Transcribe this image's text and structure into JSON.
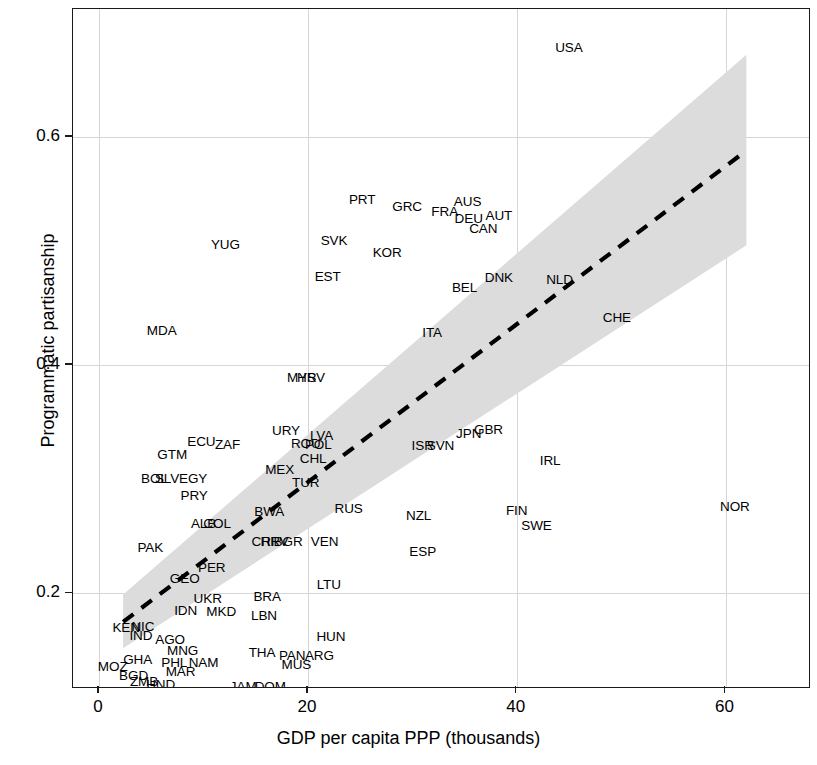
{
  "chart_data": {
    "type": "scatter",
    "title": "",
    "xlabel": "GDP per capita PPP (thousands)",
    "ylabel": "Programmatic partisanship",
    "xlim": [
      -2.5,
      68.0
    ],
    "ylim": [
      0.118,
      0.712
    ],
    "xticks": [
      0,
      20,
      40,
      60
    ],
    "xticklabels": [
      "0",
      "20",
      "40",
      "60"
    ],
    "yticks": [
      0.2,
      0.4,
      0.6
    ],
    "yticklabels": [
      "0.2",
      "0.4",
      "0.6"
    ],
    "grid": true,
    "grid_color": "#d6d6d6",
    "legend": "none",
    "marker_style": "text-label",
    "point_label_field": "iso3",
    "fit": {
      "type": "linear-regression",
      "line_style": "dashed",
      "line_color": "#000000",
      "x_start": 2.3,
      "y_start": 0.175,
      "x_end": 62.0,
      "y_end": 0.588,
      "band_label": "95% confidence interval",
      "band_color": "#dcdcdc",
      "band_lower_start": 0.152,
      "band_upper_start": 0.199,
      "band_lower_end": 0.505,
      "band_upper_end": 0.672
    },
    "points": [
      {
        "iso3": "USA",
        "x": 45.0,
        "y": 0.678
      },
      {
        "iso3": "PRT",
        "x": 25.2,
        "y": 0.545
      },
      {
        "iso3": "GRC",
        "x": 29.5,
        "y": 0.539
      },
      {
        "iso3": "AUS",
        "x": 35.3,
        "y": 0.543
      },
      {
        "iso3": "FRA",
        "x": 33.1,
        "y": 0.534
      },
      {
        "iso3": "DEU",
        "x": 35.4,
        "y": 0.528
      },
      {
        "iso3": "AUT",
        "x": 38.3,
        "y": 0.531
      },
      {
        "iso3": "CAN",
        "x": 36.8,
        "y": 0.519
      },
      {
        "iso3": "SVK",
        "x": 22.5,
        "y": 0.509
      },
      {
        "iso3": "YUG",
        "x": 12.1,
        "y": 0.505
      },
      {
        "iso3": "KOR",
        "x": 27.6,
        "y": 0.498
      },
      {
        "iso3": "EST",
        "x": 21.9,
        "y": 0.477
      },
      {
        "iso3": "DNK",
        "x": 38.3,
        "y": 0.476
      },
      {
        "iso3": "NLD",
        "x": 44.1,
        "y": 0.475
      },
      {
        "iso3": "BEL",
        "x": 35.0,
        "y": 0.468
      },
      {
        "iso3": "CHE",
        "x": 49.6,
        "y": 0.441
      },
      {
        "iso3": "MDA",
        "x": 6.0,
        "y": 0.43
      },
      {
        "iso3": "ITA",
        "x": 31.9,
        "y": 0.428
      },
      {
        "iso3": "MYS",
        "x": 19.4,
        "y": 0.389
      },
      {
        "iso3": "HRV",
        "x": 20.3,
        "y": 0.389
      },
      {
        "iso3": "JPN",
        "x": 35.4,
        "y": 0.34
      },
      {
        "iso3": "GBR",
        "x": 37.3,
        "y": 0.343
      },
      {
        "iso3": "URY",
        "x": 17.9,
        "y": 0.342
      },
      {
        "iso3": "LVA",
        "x": 21.3,
        "y": 0.338
      },
      {
        "iso3": "ECU",
        "x": 9.8,
        "y": 0.333
      },
      {
        "iso3": "ZAF",
        "x": 12.3,
        "y": 0.33
      },
      {
        "iso3": "ROU",
        "x": 19.8,
        "y": 0.331
      },
      {
        "iso3": "POL",
        "x": 21.0,
        "y": 0.33
      },
      {
        "iso3": "ISR",
        "x": 31.0,
        "y": 0.329
      },
      {
        "iso3": "SVN",
        "x": 32.7,
        "y": 0.329
      },
      {
        "iso3": "GTM",
        "x": 7.0,
        "y": 0.321
      },
      {
        "iso3": "CHL",
        "x": 20.5,
        "y": 0.318
      },
      {
        "iso3": "IRL",
        "x": 43.2,
        "y": 0.316
      },
      {
        "iso3": "MEX",
        "x": 17.3,
        "y": 0.308
      },
      {
        "iso3": "BOL",
        "x": 5.3,
        "y": 0.3
      },
      {
        "iso3": "SLV",
        "x": 6.5,
        "y": 0.3
      },
      {
        "iso3": "EGY",
        "x": 9.0,
        "y": 0.3
      },
      {
        "iso3": "TUR",
        "x": 19.8,
        "y": 0.297
      },
      {
        "iso3": "PRY",
        "x": 9.1,
        "y": 0.285
      },
      {
        "iso3": "NOR",
        "x": 60.9,
        "y": 0.276
      },
      {
        "iso3": "RUS",
        "x": 23.9,
        "y": 0.274
      },
      {
        "iso3": "BWA",
        "x": 16.3,
        "y": 0.271
      },
      {
        "iso3": "FIN",
        "x": 40.0,
        "y": 0.272
      },
      {
        "iso3": "NZL",
        "x": 30.6,
        "y": 0.268
      },
      {
        "iso3": "ALB",
        "x": 10.0,
        "y": 0.261
      },
      {
        "iso3": "COL",
        "x": 11.3,
        "y": 0.261
      },
      {
        "iso3": "SWE",
        "x": 41.9,
        "y": 0.259
      },
      {
        "iso3": "CRI",
        "x": 15.7,
        "y": 0.245
      },
      {
        "iso3": "HRV2",
        "x": 16.8,
        "y": 0.245
      },
      {
        "iso3": "BGR",
        "x": 18.1,
        "y": 0.245
      },
      {
        "iso3": "VEN",
        "x": 21.6,
        "y": 0.245
      },
      {
        "iso3": "PAK",
        "x": 4.9,
        "y": 0.24
      },
      {
        "iso3": "ESP",
        "x": 31.0,
        "y": 0.236
      },
      {
        "iso3": "PER",
        "x": 10.8,
        "y": 0.222
      },
      {
        "iso3": "GEO",
        "x": 8.2,
        "y": 0.213
      },
      {
        "iso3": "LTU",
        "x": 22.0,
        "y": 0.207
      },
      {
        "iso3": "UKR",
        "x": 10.4,
        "y": 0.195
      },
      {
        "iso3": "BRA",
        "x": 16.1,
        "y": 0.197
      },
      {
        "iso3": "IDN",
        "x": 8.3,
        "y": 0.185
      },
      {
        "iso3": "MKD",
        "x": 11.7,
        "y": 0.184
      },
      {
        "iso3": "LBN",
        "x": 15.8,
        "y": 0.18
      },
      {
        "iso3": "KEN",
        "x": 2.6,
        "y": 0.17
      },
      {
        "iso3": "NIC",
        "x": 4.2,
        "y": 0.171
      },
      {
        "iso3": "IND",
        "x": 4.0,
        "y": 0.163
      },
      {
        "iso3": "HUN",
        "x": 22.2,
        "y": 0.162
      },
      {
        "iso3": "AGO",
        "x": 6.8,
        "y": 0.159
      },
      {
        "iso3": "MNG",
        "x": 8.0,
        "y": 0.15
      },
      {
        "iso3": "THA",
        "x": 15.6,
        "y": 0.148
      },
      {
        "iso3": "PAN",
        "x": 18.5,
        "y": 0.145
      },
      {
        "iso3": "ARG",
        "x": 21.1,
        "y": 0.145
      },
      {
        "iso3": "GHA",
        "x": 3.7,
        "y": 0.142
      },
      {
        "iso3": "PHL",
        "x": 7.2,
        "y": 0.139
      },
      {
        "iso3": "NAM",
        "x": 10.0,
        "y": 0.139
      },
      {
        "iso3": "MOZ",
        "x": 1.3,
        "y": 0.136
      },
      {
        "iso3": "MUS",
        "x": 18.9,
        "y": 0.137
      },
      {
        "iso3": "MAR",
        "x": 7.8,
        "y": 0.131
      },
      {
        "iso3": "BGD",
        "x": 3.3,
        "y": 0.128
      },
      {
        "iso3": "ZMB",
        "x": 4.3,
        "y": 0.122
      },
      {
        "iso3": "HND",
        "x": 5.9,
        "y": 0.12
      },
      {
        "iso3": "JAM",
        "x": 13.8,
        "y": 0.118
      },
      {
        "iso3": "DOM",
        "x": 16.4,
        "y": 0.118
      },
      {
        "iso3": "NER",
        "x": 1.6,
        "y": 0.113
      },
      {
        "iso3": "NGA",
        "x": 4.7,
        "y": 0.113
      },
      {
        "iso3": "BEN",
        "x": 3.9,
        "y": 0.107
      },
      {
        "iso3": "SEN",
        "x": 4.2,
        "y": 0.106
      },
      {
        "iso3": "MLI",
        "x": 3.5,
        "y": 0.101
      },
      {
        "iso3": "BFA",
        "x": 4.4,
        "y": 0.1
      }
    ]
  },
  "axes": {
    "x_title": "GDP per capita PPP (thousands)",
    "y_title": "Programmatic partisanship",
    "x_tick_labels": [
      "0",
      "20",
      "40",
      "60"
    ],
    "y_tick_labels": [
      "0.2",
      "0.4",
      "0.6"
    ]
  }
}
